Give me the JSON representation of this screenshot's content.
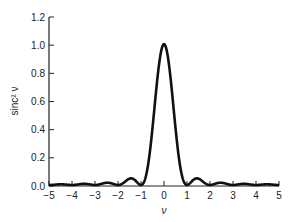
{
  "chart_data": {
    "type": "line",
    "title": "",
    "xlabel": "ν",
    "ylabel": "sinc² ν",
    "xlim": [
      -5,
      5
    ],
    "ylim": [
      0,
      1.2
    ],
    "xticks": [
      -5,
      -4,
      -3,
      -2,
      -1,
      0,
      1,
      2,
      3,
      4,
      5
    ],
    "xtick_labels": [
      "−5",
      "−4",
      "−3",
      "−2",
      "−1",
      "0",
      "1",
      "2",
      "3",
      "4",
      "5"
    ],
    "yticks": [
      0.0,
      0.2,
      0.4,
      0.6,
      0.8,
      1.0,
      1.2
    ],
    "ytick_labels": [
      "0.0",
      "0.2",
      "0.4",
      "0.6",
      "0.8",
      "1.0",
      "1.2"
    ],
    "grid": false,
    "legend": null,
    "series": [
      {
        "name": "sinc² ν",
        "function": "(sin(πν)/(πν))²",
        "x": [
          -5,
          -4.5,
          -4,
          -3.5,
          -3,
          -2.5,
          -2,
          -1.5,
          -1,
          -0.5,
          0,
          0.5,
          1,
          1.5,
          2,
          2.5,
          3,
          3.5,
          4,
          4.5,
          5
        ],
        "y": [
          0,
          0.005,
          0,
          0.008,
          0,
          0.016,
          0,
          0.045,
          0,
          0.405,
          1.0,
          0.405,
          0,
          0.045,
          0,
          0.016,
          0,
          0.008,
          0,
          0.005,
          0
        ]
      }
    ],
    "line_color": "#111111"
  }
}
